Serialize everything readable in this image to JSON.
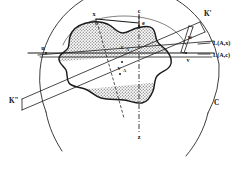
{
  "figure": {
    "background_color": "#ffffff",
    "ink_color": "#1a1a1a",
    "hatch_fill_color": "#b8b8b8",
    "body_fill_color": "#ffffff",
    "width": 249,
    "height": 171
  },
  "labels": {
    "x": "x",
    "c": "c",
    "e": "e",
    "k_prime": "K'",
    "k_double_prime": "K\"",
    "w": "w",
    "u": "u",
    "v": "v",
    "c_A": "c",
    "c_A_sub": "A",
    "v_A": "v",
    "v_A_sub": "A",
    "z": "z",
    "C": "C",
    "line_upper": "L(A,x)",
    "line_lower": "L(A,c)"
  },
  "elements": {
    "outer_circle_name": "outer-circle-C",
    "blob_name": "convex-body-K",
    "upper_shaded_name": "upper-shaded-cap",
    "lower_shaded_name": "lower-shaded-cap",
    "axis_name": "vertical-dash-dot-axis",
    "line_upper_name": "support-line-L-A-x",
    "line_lower_name": "support-line-L-A-c"
  }
}
